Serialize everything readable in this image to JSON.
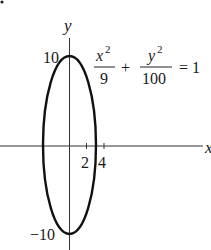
{
  "figure": {
    "marker": "•",
    "axes": {
      "x_label": "x",
      "y_label": "y",
      "x_ticks": [
        {
          "value": 2,
          "label": "2"
        },
        {
          "value": 4,
          "label": "4"
        }
      ],
      "y_ticks": [
        {
          "value": 10,
          "label": "10"
        },
        {
          "value": -10,
          "label": "−10"
        }
      ]
    },
    "equation": {
      "term1_num": "x",
      "term1_num_exp": "2",
      "term1_den": "9",
      "plus": "+",
      "term2_num": "y",
      "term2_num_exp": "2",
      "term2_den": "100",
      "equals": "= 1"
    },
    "curve": {
      "type": "ellipse",
      "semi_axis_x": 3,
      "semi_axis_y": 10,
      "stroke": "#111111"
    }
  }
}
